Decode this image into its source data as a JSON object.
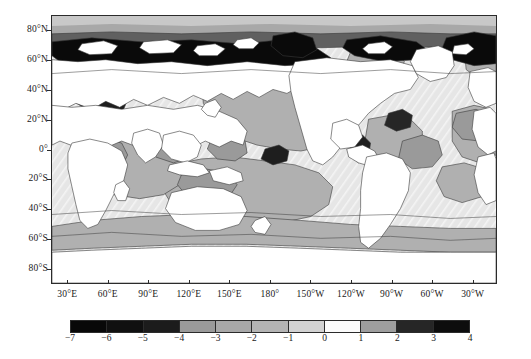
{
  "figure": {
    "kind": "global-ocean-contour-map",
    "projection": "cylindrical-equidistant",
    "background_color": "#ffffff",
    "frame_color": "#2b2b2b",
    "land_color": "#ffffff"
  },
  "axes": {
    "y_ticks": [
      {
        "label": "80°N",
        "value": 80
      },
      {
        "label": "60°N",
        "value": 60
      },
      {
        "label": "40°N",
        "value": 40
      },
      {
        "label": "20°N",
        "value": 20
      },
      {
        "label": "0°",
        "value": 0
      },
      {
        "label": "20°S",
        "value": -20
      },
      {
        "label": "40°S",
        "value": -40
      },
      {
        "label": "60°S",
        "value": -60
      },
      {
        "label": "80°S",
        "value": -80
      }
    ],
    "x_ticks": [
      {
        "label": "30°E",
        "value": 30
      },
      {
        "label": "60°E",
        "value": 60
      },
      {
        "label": "90°E",
        "value": 90
      },
      {
        "label": "120°E",
        "value": 120
      },
      {
        "label": "150°E",
        "value": 150
      },
      {
        "label": "180°",
        "value": 180
      },
      {
        "label": "150°W",
        "value": 210
      },
      {
        "label": "120°W",
        "value": 240
      },
      {
        "label": "90°W",
        "value": 270
      },
      {
        "label": "60°W",
        "value": 300
      },
      {
        "label": "30°W",
        "value": 330
      }
    ],
    "ylim": [
      -90,
      90
    ],
    "xlim": [
      18,
      348
    ]
  },
  "colorbar": {
    "orientation": "horizontal",
    "tick_labels": [
      "−7",
      "−6",
      "−5",
      "−4",
      "−3",
      "−2",
      "−1",
      "0",
      "1",
      "2",
      "3",
      "4"
    ],
    "tick_values": [
      -7,
      -6,
      -5,
      -4,
      -3,
      -2,
      -1,
      0,
      1,
      2,
      3,
      4
    ],
    "vmin": -7,
    "vmax": 4,
    "bands": [
      {
        "from": -7,
        "to": -6,
        "color": "#080808"
      },
      {
        "from": -6,
        "to": -5,
        "color": "#101010"
      },
      {
        "from": -5,
        "to": -4,
        "color": "#1c1c1c"
      },
      {
        "from": -4,
        "to": -3,
        "color": "#9a9a9a"
      },
      {
        "from": -3,
        "to": -2,
        "color": "#a8a8a8"
      },
      {
        "from": -2,
        "to": -1,
        "color": "#b4b4b4"
      },
      {
        "from": -1,
        "to": 0,
        "color": "#d2d2d2"
      },
      {
        "from": 0,
        "to": 1,
        "color": "#fbfbfb"
      },
      {
        "from": 1,
        "to": 2,
        "color": "#9e9e9e"
      },
      {
        "from": 2,
        "to": 3,
        "color": "#262626"
      },
      {
        "from": 3,
        "to": 4,
        "color": "#0d0d0d"
      }
    ]
  },
  "chart_data": {
    "type": "heatmap",
    "title": "",
    "xlabel": "",
    "ylabel": "",
    "grid": false,
    "legend_position": "bottom",
    "colormap": "grayscale-discrete",
    "levels": [
      -7,
      -6,
      -5,
      -4,
      -3,
      -2,
      -1,
      0,
      1,
      2,
      3,
      4
    ],
    "xlim": [
      18,
      348
    ],
    "ylim": [
      -90,
      90
    ],
    "regions": [
      {
        "name": "arctic-siberian-shelf",
        "lon_range": [
          20,
          180
        ],
        "lat_range": [
          72,
          84
        ],
        "value": -6.5
      },
      {
        "name": "arctic-kara-laptev",
        "lon_range": [
          60,
          140
        ],
        "lat_range": [
          70,
          82
        ],
        "value": -5.5
      },
      {
        "name": "arctic-chukchi",
        "lon_range": [
          160,
          200
        ],
        "lat_range": [
          68,
          80
        ],
        "value": -6.0
      },
      {
        "name": "greenland-sea",
        "lon_range": [
          320,
          348
        ],
        "lat_range": [
          70,
          84
        ],
        "value": -6.0
      },
      {
        "name": "north-atlantic-subpolar",
        "lon_range": [
          300,
          348
        ],
        "lat_range": [
          50,
          70
        ],
        "value": -2.5
      },
      {
        "name": "mediterranean",
        "lon_range": [
          20,
          40
        ],
        "lat_range": [
          32,
          45
        ],
        "value": -5.0
      },
      {
        "name": "north-pacific-subtropical",
        "lon_range": [
          130,
          230
        ],
        "lat_range": [
          10,
          50
        ],
        "value": -2.5
      },
      {
        "name": "north-pacific-east",
        "lon_range": [
          200,
          260
        ],
        "lat_range": [
          0,
          40
        ],
        "value": -1.0
      },
      {
        "name": "bay-of-bengal",
        "lon_range": [
          85,
          100
        ],
        "lat_range": [
          15,
          23
        ],
        "value": -5.5
      },
      {
        "name": "indian-ocean",
        "lon_range": [
          45,
          110
        ],
        "lat_range": [
          -35,
          10
        ],
        "value": -2.5
      },
      {
        "name": "arabian-sea",
        "lon_range": [
          55,
          78
        ],
        "lat_range": [
          5,
          25
        ],
        "value": -3.5
      },
      {
        "name": "equatorial-pacific-east",
        "lon_range": [
          230,
          285
        ],
        "lat_range": [
          -12,
          12
        ],
        "value": -0.5
      },
      {
        "name": "south-pacific",
        "lon_range": [
          160,
          290
        ],
        "lat_range": [
          -55,
          -15
        ],
        "value": -2.5
      },
      {
        "name": "southern-ocean",
        "lon_range": [
          18,
          348
        ],
        "lat_range": [
          -65,
          -50
        ],
        "value": -2.5
      },
      {
        "name": "south-atlantic",
        "lon_range": [
          300,
          348
        ],
        "lat_range": [
          -40,
          0
        ],
        "value": -1.0
      },
      {
        "name": "tropical-atlantic-east",
        "lon_range": [
          320,
          348
        ],
        "lat_range": [
          0,
          25
        ],
        "value": -2.5
      },
      {
        "name": "gulf-of-guinea",
        "lon_range": [
          335,
          348
        ],
        "lat_range": [
          -5,
          8
        ],
        "value": -3.0
      },
      {
        "name": "brazil-coast",
        "lon_range": [
          310,
          320
        ],
        "lat_range": [
          -25,
          -5
        ],
        "value": 3.0
      },
      {
        "name": "south-china-sea",
        "lon_range": [
          105,
          125
        ],
        "lat_range": [
          5,
          22
        ],
        "value": -3.5
      },
      {
        "name": "coral-sea",
        "lon_range": [
          145,
          165
        ],
        "lat_range": [
          -22,
          -8
        ],
        "value": -4.0
      }
    ]
  }
}
